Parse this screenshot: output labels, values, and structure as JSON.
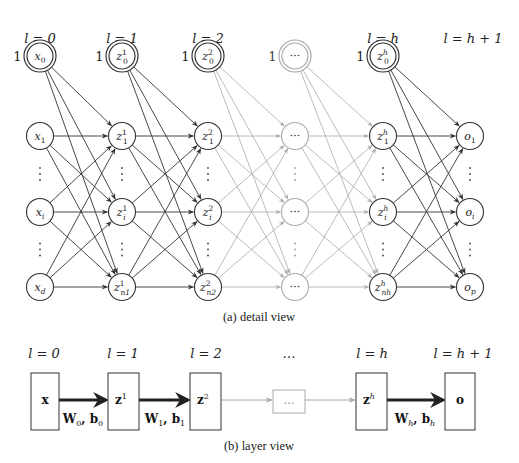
{
  "detail_view": {
    "caption": "(a) detail view",
    "layer_labels": [
      "l = 0",
      "l = 1",
      "l = 2",
      "…",
      "l = h",
      "l = h + 1"
    ],
    "bias_label": "1",
    "columns": [
      {
        "x": 40,
        "bias": "x0",
        "nodes": [
          "x1",
          "xi",
          "xd"
        ],
        "faded": false
      },
      {
        "x": 122,
        "bias": "z0^1",
        "nodes": [
          "z1^1",
          "zi^1",
          "zn1^1"
        ],
        "faded": false
      },
      {
        "x": 208,
        "bias": "z0^2",
        "nodes": [
          "z1^2",
          "zi^2",
          "zn2^2"
        ],
        "faded": false
      },
      {
        "x": 295,
        "bias": "…",
        "nodes": [
          "…",
          "…",
          "…"
        ],
        "faded": true
      },
      {
        "x": 383,
        "bias": "z0^h",
        "nodes": [
          "z1^h",
          "zi^h",
          "znh^h"
        ],
        "faded": false
      },
      {
        "x": 470,
        "bias": null,
        "nodes": [
          "o1",
          "oi",
          "op"
        ],
        "faded": false
      }
    ],
    "row_y": [
      136,
      212,
      287
    ],
    "bias_y": 56,
    "colors": {
      "solid": "#333333",
      "faded": "#aaaaaa"
    }
  },
  "layer_view": {
    "caption": "(b) layer view",
    "layer_labels": [
      "l = 0",
      "l = 1",
      "l = 2",
      "…",
      "l = h",
      "l = h + 1"
    ],
    "boxes": [
      "x",
      "z1",
      "z2",
      "…",
      "zh",
      "o"
    ],
    "edge_labels": [
      "W0, b0",
      "W1, b1",
      "Wh, bh"
    ]
  }
}
